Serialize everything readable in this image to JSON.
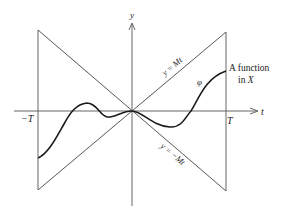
{
  "figure": {
    "axes": {
      "x_label": "t",
      "y_label": "y"
    },
    "ticks": {
      "left": "−T",
      "right": "T"
    },
    "lines": {
      "upper": "y = Mt",
      "lower": "y = −Mt"
    },
    "curve_label": "φ",
    "annotation": {
      "line1": "A function",
      "line2_prefix": "in ",
      "line2_var": "X"
    },
    "colors": {
      "line": "#444444",
      "curve": "#1a1a1a",
      "text": "#222222"
    }
  }
}
